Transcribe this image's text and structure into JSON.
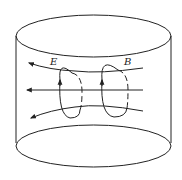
{
  "diagram": {
    "labels": {
      "e_field": "E",
      "b_field": "B"
    },
    "stroke_color": "#222222",
    "background": "#ffffff"
  }
}
